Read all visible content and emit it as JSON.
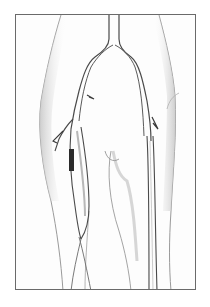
{
  "figure": {
    "colors": {
      "background": "#ffffff",
      "frame": "#6a6a6a",
      "ink": "#4a4a4a",
      "shading": "#b8b8b8",
      "graft_dark": "#2a2a2a"
    }
  }
}
